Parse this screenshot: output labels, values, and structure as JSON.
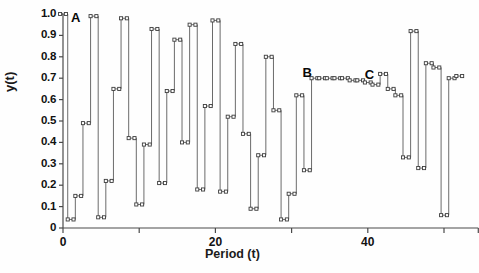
{
  "chart_data": {
    "type": "line",
    "title": "",
    "xlabel": "Period (t)",
    "ylabel": "y(t)",
    "xlim": [
      -1,
      55
    ],
    "ylim": [
      0,
      1.0
    ],
    "grid": false,
    "legend": null,
    "marker": "open-square",
    "xticks": [
      0,
      20,
      40
    ],
    "xticklabels": [
      "0",
      "20",
      "40"
    ],
    "xminorticks": [
      10,
      30,
      50
    ],
    "yticks": [
      0,
      0.1,
      0.2,
      0.3,
      0.4,
      0.5,
      0.6,
      0.7,
      0.8,
      0.9,
      1.0
    ],
    "yticklabels": [
      "0",
      "0.1",
      "0.2",
      "0.3",
      "0.4",
      "0.5",
      "0.6",
      "0.7",
      "0.8",
      "0.9",
      "1.0"
    ],
    "x": [
      0,
      1,
      2,
      3,
      4,
      5,
      6,
      7,
      8,
      9,
      10,
      11,
      12,
      13,
      14,
      15,
      16,
      17,
      18,
      19,
      20,
      21,
      22,
      23,
      24,
      25,
      26,
      27,
      28,
      29,
      30,
      31,
      32,
      33,
      34,
      35,
      36,
      37,
      38,
      39,
      40,
      41,
      42,
      43,
      44,
      45,
      46,
      47,
      48,
      49,
      50,
      51,
      52
    ],
    "values": [
      1.0,
      0.04,
      0.15,
      0.49,
      0.99,
      0.05,
      0.22,
      0.65,
      0.98,
      0.42,
      0.11,
      0.39,
      0.93,
      0.21,
      0.64,
      0.88,
      0.4,
      0.95,
      0.18,
      0.57,
      0.97,
      0.17,
      0.52,
      0.86,
      0.44,
      0.09,
      0.34,
      0.8,
      0.55,
      0.04,
      0.16,
      0.62,
      0.27,
      0.7,
      0.7,
      0.7,
      0.7,
      0.7,
      0.69,
      0.69,
      0.68,
      0.67,
      0.72,
      0.65,
      0.62,
      0.33,
      0.92,
      0.28,
      0.77,
      0.75,
      0.06,
      0.7,
      0.71
    ],
    "annotations": [
      {
        "label": "A",
        "x": 0,
        "y": 1.0
      },
      {
        "label": "B",
        "x": 33,
        "y": 0.7
      },
      {
        "label": "C",
        "x": 40,
        "y": 0.68
      }
    ]
  },
  "figure": {
    "axis_color": "#4a4a4a",
    "series_color": "#5a5a5a",
    "marker_face": "#ffffff",
    "marker_edge": "#3d3d3d",
    "background": "#fefefe"
  }
}
